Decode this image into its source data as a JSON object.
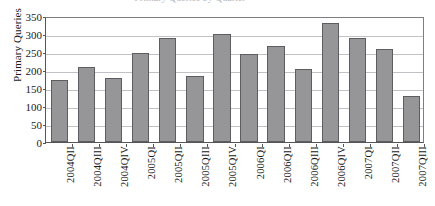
{
  "figure": {
    "title_remnant": "Primary Queries by Quarter",
    "background_color": "#ffffff"
  },
  "chart_data": {
    "type": "bar",
    "title": "",
    "xlabel": "",
    "ylabel": "Primary Queries",
    "categories": [
      "2004QII",
      "2004QIII",
      "2004QIV",
      "2005QI",
      "2005QII",
      "2005QIII",
      "2005QIV",
      "2006QI",
      "2006QII",
      "2006QIII",
      "2006QIV",
      "2007QI",
      "2007QII",
      "2007QIII"
    ],
    "values": [
      172,
      208,
      178,
      248,
      289,
      182,
      300,
      245,
      267,
      204,
      330,
      289,
      258,
      128
    ],
    "ylim": [
      0,
      350
    ],
    "y_ticks": [
      0,
      50,
      100,
      150,
      200,
      250,
      300,
      350
    ],
    "grid": true,
    "legend": "none",
    "bar_color": "#969698",
    "bar_edge_color": "#5d5d61",
    "gridline_color": "#c2c2c6",
    "axis_color": "#55555a"
  }
}
